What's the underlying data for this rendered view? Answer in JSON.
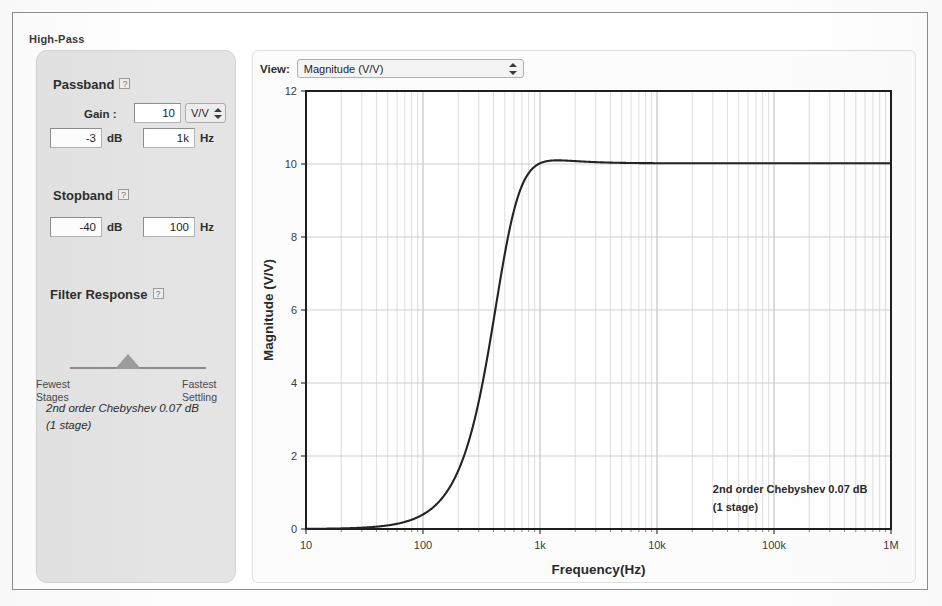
{
  "filter": {
    "type_label": "High-Pass"
  },
  "passband": {
    "title": "Passband",
    "help_icon": "?",
    "gain_label": "Gain :",
    "gain_value": "10",
    "gain_unit": "V/V",
    "ripple_value": "-3",
    "ripple_unit": "dB",
    "freq_value": "1k",
    "freq_unit": "Hz"
  },
  "stopband": {
    "title": "Stopband",
    "help_icon": "?",
    "atten_value": "-40",
    "atten_unit": "dB",
    "freq_value": "100",
    "freq_unit": "Hz"
  },
  "filter_response": {
    "title": "Filter Response",
    "help_icon": "?",
    "left_label_line1": "Fewest",
    "left_label_line2": "Stages",
    "right_label_line1": "Fastest",
    "right_label_line2": "Settling",
    "slider_percent": 43
  },
  "result": {
    "line1": "2nd order Chebyshev 0.07 dB",
    "line2": "(1 stage)"
  },
  "view": {
    "label": "View:",
    "selected": "Magnitude (V/V)"
  },
  "chart_data": {
    "type": "line",
    "title": "",
    "xlabel": "Frequency(Hz)",
    "ylabel": "Magnitude (V/V)",
    "xscale": "log",
    "yscale": "linear",
    "xlim": [
      10,
      1000000
    ],
    "ylim": [
      0,
      12
    ],
    "yticks": [
      0,
      2,
      4,
      6,
      8,
      10,
      12
    ],
    "xticks": [
      10,
      100,
      1000,
      10000,
      100000,
      1000000
    ],
    "xticklabels": [
      "10",
      "100",
      "1k",
      "10k",
      "100k",
      "1M"
    ],
    "grid": true,
    "minor_grid": true,
    "legend": "none",
    "annotation": [
      "2nd order Chebyshev 0.07 dB",
      "(1 stage)"
    ],
    "annotation_x": 30000,
    "annotation_y": 1.0,
    "series": [
      {
        "name": "Magnitude (V/V)",
        "color": "#232323",
        "filter": {
          "kind": "highpass-chebyshev",
          "order": 2,
          "ripple_db": 0.07,
          "gain": 10.1,
          "cutoff_hz": 1000
        },
        "x": [
          10,
          20,
          30,
          50,
          70,
          100,
          150,
          200,
          300,
          400,
          500,
          600,
          700,
          800,
          900,
          1000,
          1200,
          1500,
          2000,
          3000,
          5000,
          10000,
          30000,
          100000,
          300000,
          1000000
        ],
        "y": [
          0.0011,
          0.0044,
          0.0099,
          0.0275,
          0.054,
          0.11,
          0.247,
          0.435,
          0.93,
          1.54,
          2.25,
          3.0,
          3.79,
          4.55,
          5.27,
          5.94,
          7.1,
          8.35,
          9.42,
          10.08,
          10.14,
          10.12,
          10.11,
          10.11,
          10.11,
          10.11
        ]
      }
    ]
  }
}
